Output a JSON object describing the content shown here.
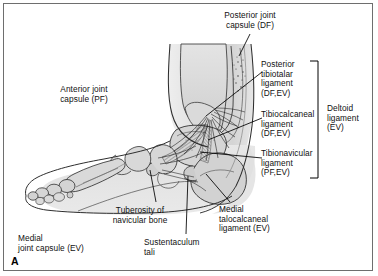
{
  "figure": {
    "panel_letter": "A",
    "border_color": "#6e6e6e",
    "background_color": "#ffffff",
    "ink_color": "#111111",
    "bone_fill": "#d7d7d7",
    "soft_tissue_fill": "#e8e8e8"
  },
  "labels": {
    "posterior_joint_capsule": "Posterior joint\ncapsule (DF)",
    "anterior_joint_capsule": "Anterior joint\ncapsule (PF)",
    "posterior_tibiotalar_ligament": "Posterior\ntibiotalar\nligament\n(DF,EV)",
    "tibiocalcaneal_ligament": "Tibiocalcaneal\nligament\n(DF,EV)",
    "tibionavicular_ligament": "Tibionavicular\nligament\n(PF,EV)",
    "deltoid_ligament": "Deltoid\nligament\n(EV)",
    "tuberosity_of_navicular_bone": "Tuberosity of\nnavicular bone",
    "sustentaculum_tali": "Sustentaculum\ntali",
    "medial_talocalcaneal_ligament": "Medial\ntalocalcaneal\nligament (EV)",
    "medial_joint_capsule": "Medial\n  joint capsule (EV)"
  },
  "annotations": {
    "bracket_name": "deltoid-ligament-bracket",
    "subject": "medial view of the right ankle and foot",
    "abbreviations_shown": [
      "DF",
      "PF",
      "EV"
    ]
  }
}
